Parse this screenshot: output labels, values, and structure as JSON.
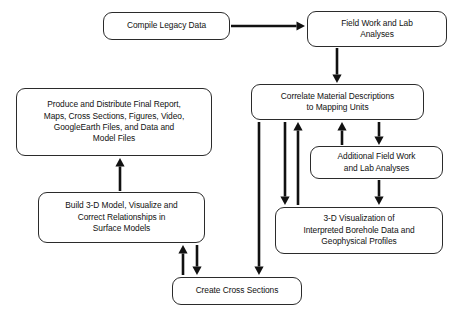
{
  "diagram": {
    "type": "flowchart",
    "background_color": "#ffffff",
    "line_color": "#111111",
    "box_border_color": "#2b2b2b",
    "nodes": [
      {
        "id": "compile-legacy-data",
        "label": "Compile Legacy Data",
        "lines": [
          "Compile Legacy Data"
        ],
        "x": 103,
        "y": 12,
        "w": 127,
        "h": 28
      },
      {
        "id": "field-work-lab-analyses",
        "label": "Field Work and Lab Analyses",
        "lines": [
          "Field Work and Lab",
          "Analyses"
        ],
        "x": 307,
        "y": 11,
        "w": 140,
        "h": 36
      },
      {
        "id": "correlate-material-descriptions",
        "label": "Correlate Material Descriptions to Mapping Units",
        "lines": [
          "Correlate Material Descriptions",
          "to Mapping Units"
        ],
        "x": 251,
        "y": 84,
        "w": 173,
        "h": 36
      },
      {
        "id": "produce-distribute-final-report",
        "label": "Produce and Distribute Final Report, Maps, Cross Sections, Figures, Video, GoogleEarth Files, and Data and Model Files",
        "lines": [
          "Produce and Distribute Final Report,",
          "Maps, Cross Sections, Figures, Video,",
          "GoogleEarth Files, and Data and",
          "Model Files"
        ],
        "x": 16,
        "y": 88,
        "w": 196,
        "h": 68
      },
      {
        "id": "additional-field-work",
        "label": "Additional Field Work and Lab Analyses",
        "lines": [
          "Additional Field Work",
          "and Lab Analyses"
        ],
        "x": 310,
        "y": 146,
        "w": 133,
        "h": 33
      },
      {
        "id": "build-3d-model",
        "label": "Build 3-D Model, Visualize and Correct Relationships in Surface Models",
        "lines": [
          "Build 3-D Model, Visualize and",
          "Correct Relationships in",
          "Surface Models"
        ],
        "x": 38,
        "y": 192,
        "w": 167,
        "h": 51
      },
      {
        "id": "3d-visualization-borehole",
        "label": "3-D Visualization of Interpreted Borehole Data and Geophysical Profiles",
        "lines": [
          "3-D Visualization of",
          "Interpreted Borehole Data and",
          "Geophysical Profiles"
        ],
        "x": 275,
        "y": 207,
        "w": 168,
        "h": 47
      },
      {
        "id": "create-cross-sections",
        "label": "Create Cross Sections",
        "lines": [
          "Create Cross Sections"
        ],
        "x": 172,
        "y": 277,
        "w": 130,
        "h": 28
      }
    ],
    "edges": [
      {
        "id": "edge-compile-to-fieldwork",
        "from": "compile-legacy-data",
        "to": "field-work-lab-analyses",
        "direction": "right",
        "x1": 231,
        "y1": 26,
        "x2": 305,
        "y2": 26
      },
      {
        "id": "edge-fieldwork-to-correlate",
        "from": "field-work-lab-analyses",
        "to": "correlate-material-descriptions",
        "direction": "down",
        "x1": 337,
        "y1": 48,
        "x2": 337,
        "y2": 83
      },
      {
        "id": "edge-correlate-to-additional",
        "from": "correlate-material-descriptions",
        "to": "additional-field-work",
        "direction": "up",
        "x1": 342,
        "y1": 145,
        "x2": 342,
        "y2": 122
      },
      {
        "id": "edge-additional-from-correlate",
        "from": "correlate-material-descriptions",
        "to": "additional-field-work",
        "direction": "down",
        "x1": 379,
        "y1": 122,
        "x2": 379,
        "y2": 145
      },
      {
        "id": "edge-additional-to-visualization",
        "from": "additional-field-work",
        "to": "3d-visualization-borehole",
        "direction": "down",
        "x1": 379,
        "y1": 180,
        "x2": 379,
        "y2": 205
      },
      {
        "id": "edge-correlate-to-visualization",
        "from": "correlate-material-descriptions",
        "to": "3d-visualization-borehole",
        "direction": "down",
        "x1": 285,
        "y1": 122,
        "x2": 285,
        "y2": 205
      },
      {
        "id": "edge-visualization-to-correlate",
        "from": "3d-visualization-borehole",
        "to": "correlate-material-descriptions",
        "direction": "up",
        "x1": 298,
        "y1": 205,
        "x2": 298,
        "y2": 122
      },
      {
        "id": "edge-correlate-to-cross-sections",
        "from": "correlate-material-descriptions",
        "to": "create-cross-sections",
        "direction": "down",
        "x1": 259,
        "y1": 122,
        "x2": 259,
        "y2": 275
      },
      {
        "id": "edge-cross-sections-to-build",
        "from": "create-cross-sections",
        "to": "build-3d-model",
        "direction": "up",
        "x1": 183,
        "y1": 275,
        "x2": 183,
        "y2": 245
      },
      {
        "id": "edge-build-to-cross-sections",
        "from": "build-3d-model",
        "to": "create-cross-sections",
        "direction": "down",
        "x1": 197,
        "y1": 245,
        "x2": 197,
        "y2": 275
      },
      {
        "id": "edge-build-to-produce",
        "from": "build-3d-model",
        "to": "produce-distribute-final-report",
        "direction": "up",
        "x1": 120,
        "y1": 191,
        "x2": 120,
        "y2": 158
      }
    ]
  }
}
